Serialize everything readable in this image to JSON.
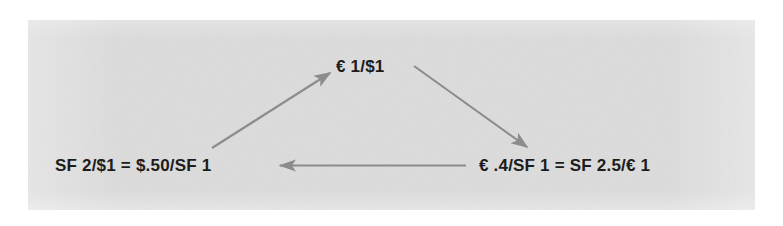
{
  "figure": {
    "panel_background": "#dcdcdc",
    "page_background": "#ffffff",
    "text_color": "#1c1c1c",
    "arrow_color": "#8c8c8c",
    "nodes": {
      "top": {
        "id": "euro-dollar-rate",
        "text": "€ 1/$1"
      },
      "bottom_left": {
        "id": "franc-dollar-rate",
        "text": "SF 2/$1 = $.50/SF 1"
      },
      "bottom_right": {
        "id": "euro-franc-rate",
        "text": "€ .4/SF 1 = SF 2.5/€ 1"
      }
    },
    "arrows": [
      {
        "id": "arrow-left-to-top",
        "from": "franc-dollar-rate",
        "to": "euro-dollar-rate",
        "direction": "up-right"
      },
      {
        "id": "arrow-top-to-right",
        "from": "euro-dollar-rate",
        "to": "euro-franc-rate",
        "direction": "down-right"
      },
      {
        "id": "arrow-right-to-left",
        "from": "euro-franc-rate",
        "to": "franc-dollar-rate",
        "direction": "left"
      }
    ]
  }
}
